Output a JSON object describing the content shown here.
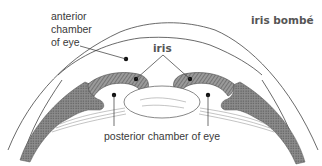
{
  "diagram": {
    "title": "iris bombé",
    "labels": {
      "anterior_chamber": [
        "anterior",
        "chamber",
        "of eye"
      ],
      "iris": "iris",
      "posterior_chamber": "posterior chamber of eye"
    },
    "colors": {
      "line": "#444444",
      "iris_fill": "#7a7a7a",
      "ciliary_fill": "#8a8a8a",
      "text": "#3a3a3a",
      "background": "#ffffff"
    }
  }
}
